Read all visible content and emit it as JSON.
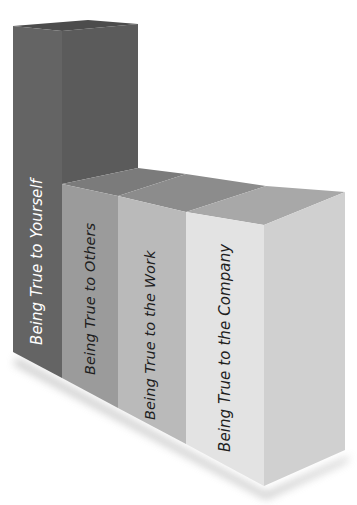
{
  "diagram": {
    "type": "stepped 3D block diagram",
    "blocks": [
      {
        "label": "Being True to Yourself",
        "level": 1,
        "front_color": "#626262",
        "side_color": "#5a5a5a",
        "top_color": "#4f4f4f",
        "text_color": "#ffffff"
      },
      {
        "label": "Being True to Others",
        "level": 2,
        "front_color": "#9a9a9a",
        "top_color": "#7a7a7a",
        "text_color": "#1e1e1e"
      },
      {
        "label": "Being True to the Work",
        "level": 3,
        "front_color": "#b9b9b9",
        "top_color": "#8f8f8f",
        "text_color": "#1e1e1e"
      },
      {
        "label": "Being True to the Company",
        "level": 4,
        "front_color": "#e4e4e4",
        "side_color": "#cfcfcf",
        "top_color": "#a9a9a9",
        "text_color": "#1e1e1e"
      }
    ]
  }
}
